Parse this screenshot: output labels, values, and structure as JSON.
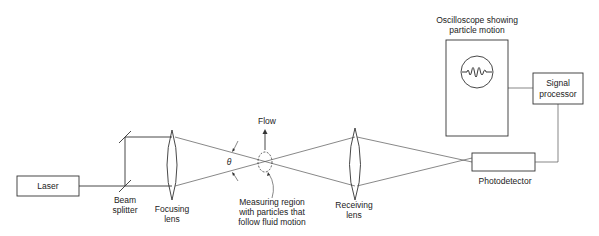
{
  "diagram": {
    "type": "Laser Doppler anemometer schematic",
    "components": {
      "laser": {
        "label": "Laser"
      },
      "beam_splitter": {
        "label_line1": "Beam",
        "label_line2": "splitter"
      },
      "focusing_lens": {
        "label_line1": "Focusing",
        "label_line2": "lens"
      },
      "measuring_region": {
        "label_line1": "Measuring region",
        "label_line2": "with particles that",
        "label_line3": "follow fluid motion"
      },
      "flow": {
        "label": "Flow"
      },
      "angle": {
        "label": "θ"
      },
      "receiving_lens": {
        "label_line1": "Receiving",
        "label_line2": "lens"
      },
      "photodetector": {
        "label": "Photodetector"
      },
      "signal_processor": {
        "label_line1": "Signal",
        "label_line2": "processor"
      },
      "oscilloscope": {
        "label_line1": "Oscilloscope showing",
        "label_line2": "particle motion"
      }
    }
  }
}
